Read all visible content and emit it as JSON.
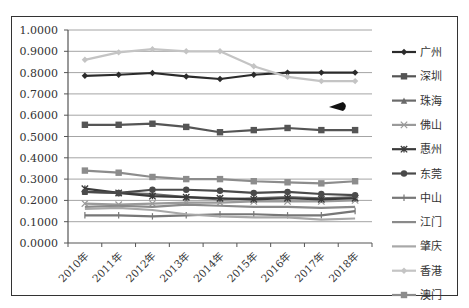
{
  "chart_data": {
    "type": "line",
    "title": "",
    "xlabel": "",
    "ylabel": "",
    "ylim": [
      0,
      1.0
    ],
    "yticks": [
      "0.0000",
      "0.1000",
      "0.2000",
      "0.3000",
      "0.4000",
      "0.5000",
      "0.6000",
      "0.7000",
      "0.8000",
      "0.9000",
      "1.0000"
    ],
    "grid": true,
    "legend_position": "right",
    "categories": [
      "2010年",
      "2011年",
      "2012年",
      "2013年",
      "2014年",
      "2015年",
      "2016年",
      "2017年",
      "2018年"
    ],
    "series": [
      {
        "name": "广州",
        "color": "#2b2b2b",
        "marker": "diamond",
        "values": [
          0.785,
          0.79,
          0.798,
          0.782,
          0.77,
          0.79,
          0.8,
          0.8,
          0.8
        ]
      },
      {
        "name": "深圳",
        "color": "#555555",
        "marker": "square",
        "values": [
          0.555,
          0.555,
          0.56,
          0.545,
          0.52,
          0.53,
          0.54,
          0.53,
          0.53
        ]
      },
      {
        "name": "珠海",
        "color": "#6a6a6a",
        "marker": "triangle",
        "values": [
          0.24,
          0.235,
          0.23,
          0.215,
          0.205,
          0.21,
          0.215,
          0.21,
          0.215
        ]
      },
      {
        "name": "佛山",
        "color": "#9a9a9a",
        "marker": "x",
        "values": [
          0.185,
          0.18,
          0.185,
          0.19,
          0.19,
          0.195,
          0.195,
          0.195,
          0.2
        ]
      },
      {
        "name": "惠州",
        "color": "#3a3a3a",
        "marker": "star",
        "values": [
          0.255,
          0.235,
          0.22,
          0.215,
          0.21,
          0.205,
          0.21,
          0.205,
          0.21
        ]
      },
      {
        "name": "东莞",
        "color": "#4a4a4a",
        "marker": "circle",
        "values": [
          0.24,
          0.235,
          0.25,
          0.25,
          0.245,
          0.235,
          0.24,
          0.23,
          0.225
        ]
      },
      {
        "name": "中山",
        "color": "#777777",
        "marker": "plus",
        "values": [
          0.13,
          0.13,
          0.125,
          0.13,
          0.135,
          0.135,
          0.13,
          0.13,
          0.15
        ]
      },
      {
        "name": "江门",
        "color": "#8a8a8a",
        "marker": "none",
        "values": [
          0.17,
          0.175,
          0.17,
          0.18,
          0.175,
          0.17,
          0.17,
          0.165,
          0.17
        ]
      },
      {
        "name": "肇庆",
        "color": "#a8a8a8",
        "marker": "none",
        "values": [
          0.16,
          0.165,
          0.155,
          0.135,
          0.125,
          0.12,
          0.12,
          0.11,
          0.115
        ]
      },
      {
        "name": "香港",
        "color": "#c4c4c4",
        "marker": "diamond",
        "values": [
          0.86,
          0.895,
          0.91,
          0.9,
          0.9,
          0.83,
          0.78,
          0.76,
          0.76
        ]
      },
      {
        "name": "澳门",
        "color": "#8c8c8c",
        "marker": "square",
        "values": [
          0.34,
          0.33,
          0.31,
          0.3,
          0.3,
          0.29,
          0.285,
          0.28,
          0.29
        ]
      }
    ]
  },
  "annotations": {
    "cursor_arrow": "black-arrow"
  }
}
